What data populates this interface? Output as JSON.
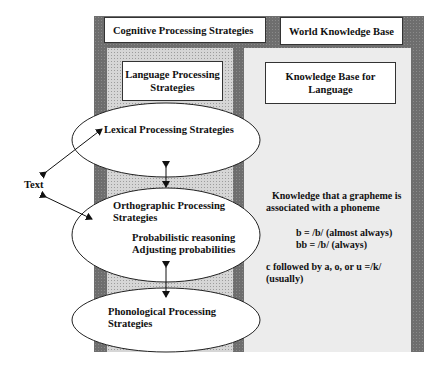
{
  "title_left": "Cognitive Processing Strategies",
  "title_right": "World Knowledge Base",
  "left_box": {
    "line1": "Language Processing",
    "line2": "Strategies"
  },
  "right_box": {
    "line1": "Knowledge Base for",
    "line2": "Language"
  },
  "text_node": "Text",
  "ellipses": {
    "lexical": {
      "line1": "Lexical Processing Strategies"
    },
    "orthographic": {
      "line1": "Orthographic Processing",
      "line2": "Strategies",
      "sub1": "Probabilistic reasoning",
      "sub2": "Adjusting probabilities"
    },
    "phonological": {
      "line1": "Phonological Processing",
      "line2": "Strategies"
    }
  },
  "knowledge": {
    "line1": "Knowledge that a grapheme is",
    "line2": "associated with a phoneme",
    "rule1": "b = /b/ (almost always)",
    "rule2": "bb = /b/ (always)",
    "rule3a": "c followed by a, o, or u =/k/",
    "rule3b": "(usually)"
  },
  "colors": {
    "frame": "#6e6e6e",
    "left_panel": "#d6d6d6",
    "right_panel": "#ececec"
  }
}
